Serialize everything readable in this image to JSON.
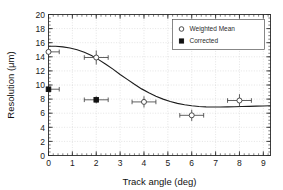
{
  "chart_data": {
    "type": "scatter",
    "title": "",
    "xlabel": "Track angle   (deg)",
    "ylabel": "Resolution   (μm)",
    "xlim": [
      0,
      9.3
    ],
    "ylim": [
      0,
      20
    ],
    "xticks": [
      0,
      1,
      2,
      3,
      4,
      5,
      6,
      7,
      8,
      9
    ],
    "yticks": [
      0,
      2,
      4,
      6,
      8,
      10,
      12,
      14,
      16,
      18,
      20
    ],
    "xtick_labels": [
      "0",
      "1",
      "2",
      "3",
      "4",
      "5",
      "6",
      "7",
      "8",
      "9"
    ],
    "ytick_labels": [
      "0",
      "2",
      "4",
      "6",
      "8",
      "10",
      "12",
      "14",
      "16",
      "18",
      "20"
    ],
    "xminor_step": 0.2,
    "yminor_step": 0.5,
    "grid": true,
    "legend_position": "top-right",
    "series": [
      {
        "name": "Weighted Mean",
        "marker": "open-circle",
        "color": "#3a3a3a",
        "points": [
          {
            "x": 0.0,
            "y": 14.7,
            "xerr": 0.45,
            "yerr": 0.5
          },
          {
            "x": 2.0,
            "y": 13.9,
            "xerr": 0.5,
            "yerr": 1.0
          },
          {
            "x": 4.0,
            "y": 7.6,
            "xerr": 0.5,
            "yerr": 0.8
          },
          {
            "x": 6.0,
            "y": 5.7,
            "xerr": 0.5,
            "yerr": 0.8
          },
          {
            "x": 8.0,
            "y": 7.8,
            "xerr": 0.5,
            "yerr": 0.9
          }
        ]
      },
      {
        "name": "Corrected",
        "marker": "filled-square",
        "color": "#111111",
        "points": [
          {
            "x": 0.0,
            "y": 9.4,
            "xerr": 0.45,
            "yerr": 0.4
          },
          {
            "x": 2.0,
            "y": 7.9,
            "xerr": 0.5,
            "yerr": 0.5
          }
        ]
      }
    ],
    "fit_curve": {
      "name": "fit",
      "color": "#1c1c1c",
      "x": [
        0.0,
        0.3,
        0.6,
        0.9,
        1.2,
        1.5,
        1.8,
        2.1,
        2.4,
        2.7,
        3.0,
        3.3,
        3.6,
        3.9,
        4.2,
        4.5,
        4.8,
        5.1,
        5.4,
        5.7,
        6.0,
        6.3,
        6.6,
        6.9,
        7.2,
        7.5,
        7.8,
        8.1,
        8.4,
        8.7,
        9.0,
        9.3
      ],
      "y": [
        15.5,
        15.5,
        15.4,
        15.25,
        15.0,
        14.65,
        14.2,
        13.6,
        12.95,
        12.25,
        11.5,
        10.8,
        10.1,
        9.45,
        8.9,
        8.4,
        8.0,
        7.65,
        7.4,
        7.2,
        7.05,
        6.95,
        6.9,
        6.88,
        6.88,
        6.9,
        6.92,
        6.95,
        6.97,
        7.0,
        7.02,
        7.05
      ]
    },
    "legend": [
      {
        "label": "Weighted Mean",
        "marker": "open-circle"
      },
      {
        "label": "Corrected",
        "marker": "filled-square"
      }
    ]
  }
}
